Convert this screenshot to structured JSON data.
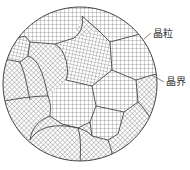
{
  "figure": {
    "colors": {
      "background": "#ffffff",
      "line": "#444444",
      "hatch": "#6a6a6a"
    },
    "circle": {
      "cx": 80,
      "cy": 84,
      "r": 77
    },
    "labels": {
      "grain": "晶粒",
      "grain_boundary": "晶界"
    }
  }
}
